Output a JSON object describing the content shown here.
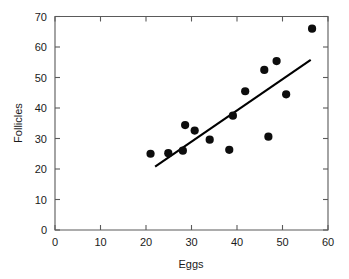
{
  "chart_data": {
    "type": "scatter",
    "title": "",
    "xlabel": "Eggs",
    "ylabel": "Follicles",
    "xlim": [
      0,
      60
    ],
    "ylim": [
      0,
      70
    ],
    "xticks": [
      0,
      10,
      20,
      30,
      40,
      50,
      60
    ],
    "yticks": [
      0,
      10,
      20,
      30,
      40,
      50,
      60,
      70
    ],
    "xtick_labels": [
      "0",
      "10",
      "20",
      "30",
      "40",
      "50",
      "60"
    ],
    "ytick_labels": [
      "0",
      "10",
      "20",
      "30",
      "40",
      "50",
      "60",
      "70"
    ],
    "grid": false,
    "legend": false,
    "legend_position": "none",
    "series": [
      {
        "name": "Observations",
        "marker": "filled-circle",
        "color": "#0d0d0d",
        "points": [
          {
            "x": 21.0,
            "y": 25.0
          },
          {
            "x": 24.9,
            "y": 25.2
          },
          {
            "x": 28.1,
            "y": 26.0
          },
          {
            "x": 28.6,
            "y": 34.4
          },
          {
            "x": 30.7,
            "y": 32.6
          },
          {
            "x": 34.0,
            "y": 29.6
          },
          {
            "x": 38.3,
            "y": 26.3
          },
          {
            "x": 39.1,
            "y": 37.5
          },
          {
            "x": 41.8,
            "y": 45.5
          },
          {
            "x": 46.0,
            "y": 52.5
          },
          {
            "x": 46.9,
            "y": 30.6
          },
          {
            "x": 48.7,
            "y": 55.4
          },
          {
            "x": 50.8,
            "y": 44.5
          },
          {
            "x": 56.5,
            "y": 66.0
          }
        ]
      }
    ],
    "fit_line": {
      "name": "Least-squares fit",
      "color": "#000000",
      "x_start": 22.0,
      "y_start": 20.8,
      "x_end": 56.2,
      "y_end": 55.8
    }
  },
  "axes": {
    "x_title": "Eggs",
    "y_title": "Follicles"
  }
}
